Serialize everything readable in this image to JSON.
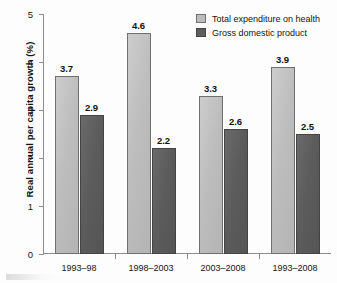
{
  "chart_data": {
    "type": "bar",
    "title": "",
    "subtitle": "",
    "xlabel": "",
    "ylabel": "Real annual per capita growth (%)",
    "ylim": [
      0,
      5
    ],
    "ytick_labels": [
      "0",
      "1",
      "2",
      "3",
      "4",
      "5"
    ],
    "ytick_values": [
      0,
      1,
      2,
      3,
      4,
      5
    ],
    "grid": false,
    "legend_position": "top-right",
    "categories": [
      "1993–98",
      "1998–2003",
      "2003–2008",
      "1993–2008"
    ],
    "series": [
      {
        "name": "Total expenditure on health",
        "color": "#bdbdbd",
        "values": [
          3.7,
          4.6,
          3.3,
          3.9
        ],
        "value_labels": [
          "3.7",
          "4.6",
          "3.3",
          "3.9"
        ]
      },
      {
        "name": "Gross domestic product",
        "color": "#5d5d5d",
        "values": [
          2.9,
          2.2,
          2.6,
          2.5
        ],
        "value_labels": [
          "2.9",
          "2.2",
          "2.6",
          "2.5"
        ]
      }
    ]
  },
  "legend": {
    "items": [
      {
        "label": "Total expenditure on health",
        "swatch": "light"
      },
      {
        "label": "Gross domestic product",
        "swatch": "dark"
      }
    ]
  },
  "axes": {
    "y_title": "Real annual per capita growth (%)",
    "y_ticks": [
      "5",
      "4",
      "3",
      "2",
      "1",
      "0"
    ],
    "x_labels": [
      "1993–98",
      "1998–2003",
      "2003–2008",
      "1993–2008"
    ]
  },
  "colors": {
    "light_bar": "#bdbdbd",
    "dark_bar": "#5d5d5d",
    "axis": "#8c8c8c",
    "text": "#141414",
    "background": "#fdfdfd"
  }
}
